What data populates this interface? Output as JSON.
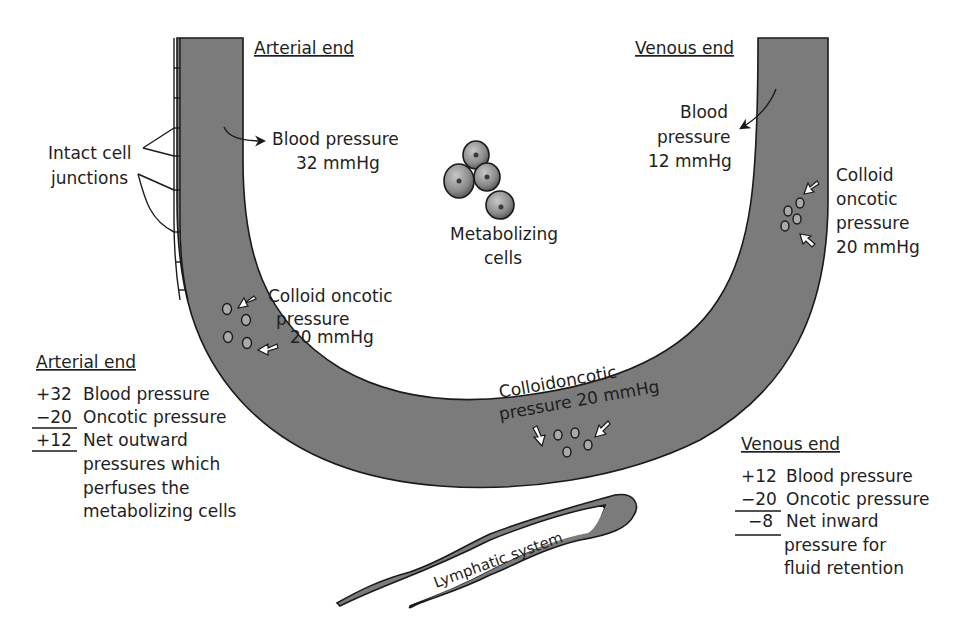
{
  "diagram": {
    "top_labels": {
      "arterial_end": "Arterial end",
      "venous_end": "Venous end"
    },
    "arterial_side": {
      "blood_pressure_line1": "Blood pressure",
      "blood_pressure_line2": "32 mmHg",
      "colloid_line1": "Colloid oncotic",
      "colloid_line2": "pressure",
      "colloid_line3": "20 mmHg"
    },
    "venous_side": {
      "blood_pressure_line1": "Blood",
      "blood_pressure_line2": "pressure",
      "blood_pressure_line3": "12 mmHg",
      "colloid_line1": "Colloid",
      "colloid_line2": "oncotic",
      "colloid_line3": "pressure",
      "colloid_line4": "20 mmHg"
    },
    "bottom_colloid": {
      "line1": "Colloidoncotic",
      "line2": "pressure 20 mmHg"
    },
    "intact_junctions": {
      "line1": "Intact cell",
      "line2": "junctions"
    },
    "metabolizing_cells": {
      "line1": "Metabolizing",
      "line2": "cells"
    },
    "lymphatic_label": "Lymphatic system",
    "arterial_summary": {
      "title": "Arterial end",
      "rows": [
        {
          "value": "+32",
          "label": "Blood pressure"
        },
        {
          "value": "−20",
          "label": "Oncotic pressure"
        },
        {
          "value": "+12",
          "label": "Net outward"
        }
      ],
      "continuation": [
        "pressures which",
        "perfuses the",
        "metabolizing cells"
      ]
    },
    "venous_summary": {
      "title": "Venous end",
      "rows": [
        {
          "value": "+12",
          "label": "Blood pressure"
        },
        {
          "value": "−20",
          "label": "Oncotic pressure"
        },
        {
          "value": "−8",
          "label": "Net inward"
        }
      ],
      "continuation": [
        "pressure for",
        "fluid retention"
      ]
    },
    "colors": {
      "vessel_fill": "#7b7b7b",
      "outline": "#1a1a1a",
      "background": "#ffffff"
    }
  }
}
